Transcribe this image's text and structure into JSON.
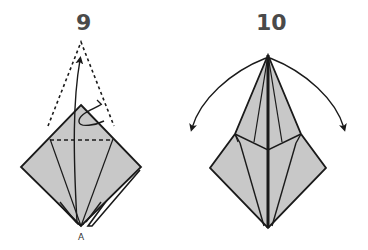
{
  "diagram": {
    "type": "origami-instructions",
    "colors": {
      "paper": "#c8c8c8",
      "line": "#1a1a1a",
      "number": "#4a4a4a",
      "background": "#ffffff"
    },
    "steps": [
      {
        "number": "9",
        "description": "Petal fold: lift bottom corner up along dashed valley fold, flaps fold inward",
        "point_label": "A",
        "symbols": [
          "valley-fold-dashed-line",
          "fold-up-arrow",
          "hidden-outline-dotted",
          "repeat-loop-arrow"
        ]
      },
      {
        "number": "10",
        "description": "Result of petal fold; open flaps outward",
        "symbols": [
          "curved-arrow-left",
          "curved-arrow-right"
        ]
      }
    ]
  }
}
